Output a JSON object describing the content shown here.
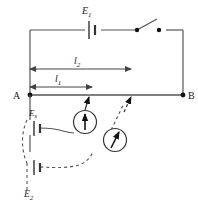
{
  "figure": {
    "type": "circuit-diagram",
    "background_color": "#ffffff",
    "line_color": "#555555",
    "text_color": "#1a1a1a"
  },
  "labels": {
    "driver_cell": "E",
    "driver_cell_sub": "1",
    "standard_cell": "E",
    "standard_cell_sub": "s",
    "second_cell": "E",
    "second_cell_sub": "2",
    "length_long": "l",
    "length_long_sub": "2",
    "length_short": "l",
    "length_short_sub": "1",
    "terminal_left": "A",
    "terminal_right": "B"
  },
  "components": {
    "battery_e1": "battery-symbol",
    "battery_es": "battery-symbol",
    "battery_e2": "battery-symbol",
    "switch": "open-knife-switch",
    "galvanometer_1": "galvanometer-circle-arrow",
    "galvanometer_2": "galvanometer-circle-arrow",
    "slider_1": "sliding-contact-arrow",
    "slider_2": "sliding-contact-arrow",
    "junction_a": "junction-dot",
    "junction_b": "junction-dot"
  },
  "measurements": {
    "l2_span_start_x": 30,
    "l2_span_end_x": 131,
    "l1_span_start_x": 30,
    "l1_span_end_x": 92,
    "wire_ab_y": 95,
    "terminal_a_x": 30,
    "terminal_b_x": 183
  }
}
